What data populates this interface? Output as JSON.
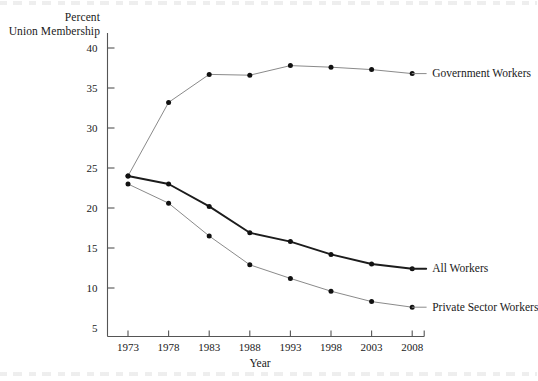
{
  "chart_data": {
    "type": "line",
    "title": "",
    "xlabel": "Year",
    "ylabel": "Percent Union Membership",
    "ylabel_lines": [
      "Percent",
      "Union Membership"
    ],
    "x": [
      1973,
      1978,
      1983,
      1988,
      1993,
      1998,
      2003,
      2008
    ],
    "xtick_labels": [
      "1973",
      "1978",
      "1983",
      "1988",
      "1993",
      "1998",
      "2003",
      "2008"
    ],
    "ytick_labels": [
      "40",
      "35",
      "30",
      "25",
      "20",
      "15",
      "10",
      "5"
    ],
    "ytick_values": [
      40,
      35,
      30,
      25,
      20,
      15,
      10,
      5
    ],
    "ylim": [
      5,
      41
    ],
    "xlim": [
      1971.2,
      2009.8
    ],
    "grid": false,
    "legend_position": "right-of-line-ends",
    "series": [
      {
        "name": "Government Workers",
        "values": [
          24.0,
          33.2,
          36.7,
          36.6,
          37.8,
          37.6,
          37.3,
          36.8
        ],
        "color": "#8a8a8a",
        "line_width": 1.0,
        "marker": "filled-circle"
      },
      {
        "name": "All Workers",
        "values": [
          24.0,
          23.0,
          20.2,
          16.9,
          15.8,
          14.2,
          13.0,
          12.4
        ],
        "color": "#1c1c1c",
        "line_width": 1.9,
        "marker": "filled-circle"
      },
      {
        "name": "Private Sector Workers",
        "values": [
          23.0,
          20.6,
          16.5,
          12.9,
          11.2,
          9.6,
          8.3,
          7.6
        ],
        "color": "#8a8a8a",
        "line_width": 1.0,
        "marker": "filled-circle"
      }
    ],
    "series_labels": [
      {
        "text": "Government Workers",
        "value_at_end": 36.8
      },
      {
        "text": "All Workers",
        "value_at_end": 12.4
      },
      {
        "text": "Private Sector Workers",
        "value_at_end": 7.6
      }
    ]
  },
  "axis": {
    "axis_color": "#555555"
  }
}
